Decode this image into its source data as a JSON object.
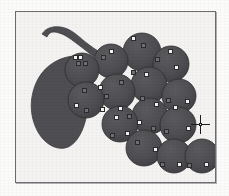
{
  "window": {
    "title": "Grape cluster clipart — node edit view",
    "background_color": "#fbfbfa"
  },
  "canvas": {
    "label": "drawing-canvas",
    "frame_border_color": "#6d6a70",
    "paper_color": "#f4f3f1",
    "x": 15,
    "y": 11,
    "width": 199,
    "height": 170
  },
  "artwork": {
    "name": "grape-bunch",
    "fill_color": "#4f4e52",
    "outline_color": "#2f2e31",
    "stem": {
      "name": "grape-stem",
      "fill_color": "#4f4e52"
    },
    "leaf": {
      "name": "grape-leaf",
      "fill_color": "#4f4e52"
    },
    "berries": [
      {
        "cx": 66,
        "cy": 58,
        "r": 17
      },
      {
        "cx": 95,
        "cy": 49,
        "r": 17
      },
      {
        "cx": 126,
        "cy": 40,
        "r": 19
      },
      {
        "cx": 155,
        "cy": 52,
        "r": 18
      },
      {
        "cx": 70,
        "cy": 88,
        "r": 18
      },
      {
        "cx": 101,
        "cy": 80,
        "r": 18
      },
      {
        "cx": 133,
        "cy": 73,
        "r": 18
      },
      {
        "cx": 163,
        "cy": 84,
        "r": 17
      },
      {
        "cx": 104,
        "cy": 112,
        "r": 18
      },
      {
        "cx": 134,
        "cy": 104,
        "r": 18
      },
      {
        "cx": 162,
        "cy": 113,
        "r": 18
      },
      {
        "cx": 128,
        "cy": 136,
        "r": 18
      },
      {
        "cx": 158,
        "cy": 144,
        "r": 17
      },
      {
        "cx": 186,
        "cy": 144,
        "r": 17
      }
    ]
  },
  "node_handles": {
    "label": "path-node-handles",
    "style": "square",
    "size_px": 5,
    "fill_color": "#f2f1ef",
    "stroke_color": "#2b2b2d",
    "selected_fill_color": "#6f6e72",
    "count": 40,
    "points": [
      {
        "x": 59,
        "y": 45,
        "selected": false
      },
      {
        "x": 64,
        "y": 45,
        "selected": false
      },
      {
        "x": 62,
        "y": 51,
        "selected": true
      },
      {
        "x": 69,
        "y": 51,
        "selected": true
      },
      {
        "x": 87,
        "y": 45,
        "selected": true
      },
      {
        "x": 95,
        "y": 39,
        "selected": false
      },
      {
        "x": 117,
        "y": 26,
        "selected": false
      },
      {
        "x": 127,
        "y": 33,
        "selected": true
      },
      {
        "x": 141,
        "y": 47,
        "selected": true
      },
      {
        "x": 154,
        "y": 39,
        "selected": false
      },
      {
        "x": 160,
        "y": 55,
        "selected": false
      },
      {
        "x": 117,
        "y": 60,
        "selected": true
      },
      {
        "x": 130,
        "y": 62,
        "selected": false
      },
      {
        "x": 68,
        "y": 78,
        "selected": true
      },
      {
        "x": 84,
        "y": 75,
        "selected": false
      },
      {
        "x": 90,
        "y": 84,
        "selected": true
      },
      {
        "x": 105,
        "y": 70,
        "selected": true
      },
      {
        "x": 60,
        "y": 93,
        "selected": false
      },
      {
        "x": 70,
        "y": 98,
        "selected": true
      },
      {
        "x": 86,
        "y": 97,
        "selected": false
      },
      {
        "x": 104,
        "y": 96,
        "selected": false
      },
      {
        "x": 126,
        "y": 86,
        "selected": true
      },
      {
        "x": 140,
        "y": 92,
        "selected": false
      },
      {
        "x": 152,
        "y": 88,
        "selected": true
      },
      {
        "x": 159,
        "y": 95,
        "selected": false
      },
      {
        "x": 171,
        "y": 89,
        "selected": false
      },
      {
        "x": 100,
        "y": 105,
        "selected": false
      },
      {
        "x": 113,
        "y": 104,
        "selected": true
      },
      {
        "x": 123,
        "y": 110,
        "selected": false
      },
      {
        "x": 137,
        "y": 116,
        "selected": true
      },
      {
        "x": 96,
        "y": 123,
        "selected": true
      },
      {
        "x": 111,
        "y": 121,
        "selected": false
      },
      {
        "x": 150,
        "y": 119,
        "selected": true
      },
      {
        "x": 172,
        "y": 116,
        "selected": false
      },
      {
        "x": 121,
        "y": 130,
        "selected": true
      },
      {
        "x": 139,
        "y": 137,
        "selected": false
      },
      {
        "x": 146,
        "y": 152,
        "selected": true
      },
      {
        "x": 163,
        "y": 152,
        "selected": false
      },
      {
        "x": 173,
        "y": 153,
        "selected": true
      },
      {
        "x": 190,
        "y": 152,
        "selected": false
      }
    ]
  },
  "cursor": {
    "label": "crosshair-cursor",
    "x": 184,
    "y": 112,
    "color": "#1e1e20"
  }
}
